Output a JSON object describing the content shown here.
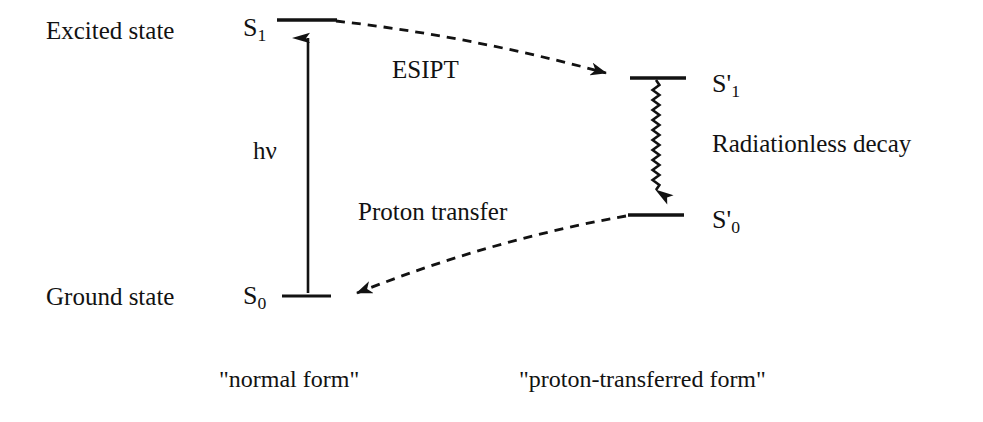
{
  "figure": {
    "kind": "jablonski-energy-level-diagram",
    "width": 983,
    "height": 422,
    "background_color": "#ffffff",
    "ink_color": "#121212"
  },
  "axis_labels": {
    "excited_state": "Excited state",
    "ground_state": "Ground state"
  },
  "states": [
    {
      "id": "S1",
      "symbol": "S",
      "prime": "",
      "subscript": "1",
      "label": "S1",
      "column": "normal form",
      "energy_rank": "excited",
      "line": {
        "x1": 277,
        "x2": 337,
        "y": 20
      },
      "label_pos": {
        "x": 243,
        "y": 18
      }
    },
    {
      "id": "S0",
      "symbol": "S",
      "prime": "",
      "subscript": "0",
      "label": "S0",
      "column": "normal form",
      "energy_rank": "ground",
      "line": {
        "x1": 282,
        "x2": 331,
        "y": 296
      },
      "label_pos": {
        "x": 243,
        "y": 284
      }
    },
    {
      "id": "S1prime",
      "symbol": "S",
      "prime": "'",
      "subscript": "1",
      "label": "S'1",
      "column": "proton-transferred form",
      "energy_rank": "excited",
      "line": {
        "x1": 630,
        "x2": 686,
        "y": 78
      },
      "label_pos": {
        "x": 712,
        "y": 74
      }
    },
    {
      "id": "S0prime",
      "symbol": "S",
      "prime": "'",
      "subscript": "0",
      "label": "S'0",
      "column": "proton-transferred form",
      "energy_rank": "ground",
      "line": {
        "x1": 628,
        "x2": 684,
        "y": 215
      },
      "label_pos": {
        "x": 712,
        "y": 210
      }
    }
  ],
  "transitions": [
    {
      "id": "absorption",
      "label": "hv",
      "label_html_h": "h",
      "label_html_nu": "ν",
      "style": "solid-straight-arrow",
      "direction": "up",
      "from": "S0",
      "to": "S1",
      "x": 308,
      "y_start": 292,
      "y_end": 24,
      "label_pos": {
        "x": 253,
        "y": 139
      }
    },
    {
      "id": "esipt",
      "label": "ESIPT",
      "style": "dashed-arrow",
      "direction": "right-down",
      "from": "S1",
      "to": "S1prime",
      "start": {
        "x": 337,
        "y": 21
      },
      "end": {
        "x": 624,
        "y": 77
      },
      "label_pos": {
        "x": 392,
        "y": 58
      }
    },
    {
      "id": "radiationless-decay",
      "label": "Radiationless decay",
      "style": "wavy-arrow",
      "direction": "down",
      "from": "S1prime",
      "to": "S0prime",
      "x": 656,
      "y_start": 80,
      "y_end": 212,
      "label_pos": {
        "x": 712,
        "y": 133
      }
    },
    {
      "id": "proton-transfer",
      "label": "Proton transfer",
      "style": "dashed-arrow",
      "direction": "left-down",
      "from": "S0prime",
      "to": "S0",
      "start": {
        "x": 626,
        "y": 216
      },
      "end": {
        "x": 340,
        "y": 295
      },
      "label_pos": {
        "x": 358,
        "y": 200
      }
    }
  ],
  "captions": [
    {
      "id": "normal-form",
      "text": "\"normal form\"",
      "pos": {
        "x": 219,
        "y": 369
      }
    },
    {
      "id": "proton-transferred-form",
      "text": "\"proton-transferred form\"",
      "pos": {
        "x": 519,
        "y": 369
      }
    }
  ]
}
